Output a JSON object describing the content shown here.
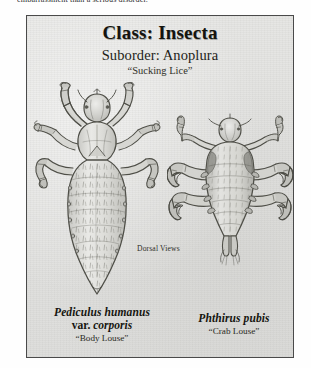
{
  "page": {
    "preceding_text": "embarrassment than a serious disorder."
  },
  "plate": {
    "heading_class": "Class: Insecta",
    "heading_suborder": "Suborder: Anoplura",
    "heading_common": "“Sucking Lice”",
    "view_note": "Dorsal Views",
    "border_color": "#4a4a4a",
    "background_color": "#e3e3e1"
  },
  "specimens": [
    {
      "id": "body-louse",
      "genus_species": "Pediculus humanus",
      "variety_prefix": "var.",
      "variety": "corporis",
      "common_name": "“Body Louse”",
      "view": "dorsal"
    },
    {
      "id": "crab-louse",
      "genus_species": "Phthirus pubis",
      "common_name": "“Crab Louse”",
      "view": "dorsal"
    }
  ]
}
